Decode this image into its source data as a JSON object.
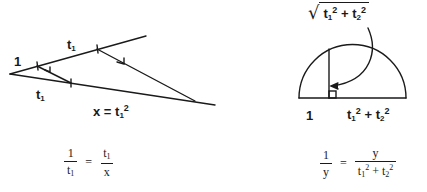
{
  "figure": {
    "left_diagram": {
      "label_one": "1",
      "label_t1_upper": "t",
      "label_t1_upper_sub": "1",
      "label_t1_lower": "t",
      "label_t1_lower_sub": "1",
      "label_x_eq": "x = t",
      "label_x_sub": "1",
      "label_x_sup": "2"
    },
    "right_diagram": {
      "sqrt_t1": "t",
      "sqrt_t1_sub": "1",
      "sqrt_t1_sup": "2",
      "sqrt_plus": " + ",
      "sqrt_t2": "t",
      "sqrt_t2_sub": "2",
      "sqrt_t2_sup": "2",
      "base_label_one": "1",
      "base_t1": "t",
      "base_t1_sub": "1",
      "base_t1_sup": "2",
      "base_plus": " + ",
      "base_t2": "t",
      "base_t2_sub": "2",
      "base_t2_sup": "2"
    },
    "equation_left": {
      "lhs_num": "1",
      "lhs_den": "t",
      "lhs_den_sub": "1",
      "op": "=",
      "rhs_num": "t",
      "rhs_num_sub": "1",
      "rhs_den": "x"
    },
    "equation_right": {
      "lhs_num": "1",
      "lhs_den": "y",
      "op": "=",
      "rhs_num": "y",
      "rhs_den_t1": "t",
      "rhs_den_t1_sub": "1",
      "rhs_den_t1_sup": "2",
      "rhs_den_plus": " + ",
      "rhs_den_t2": "t",
      "rhs_den_t2_sub": "2",
      "rhs_den_t2_sup": "2"
    }
  }
}
